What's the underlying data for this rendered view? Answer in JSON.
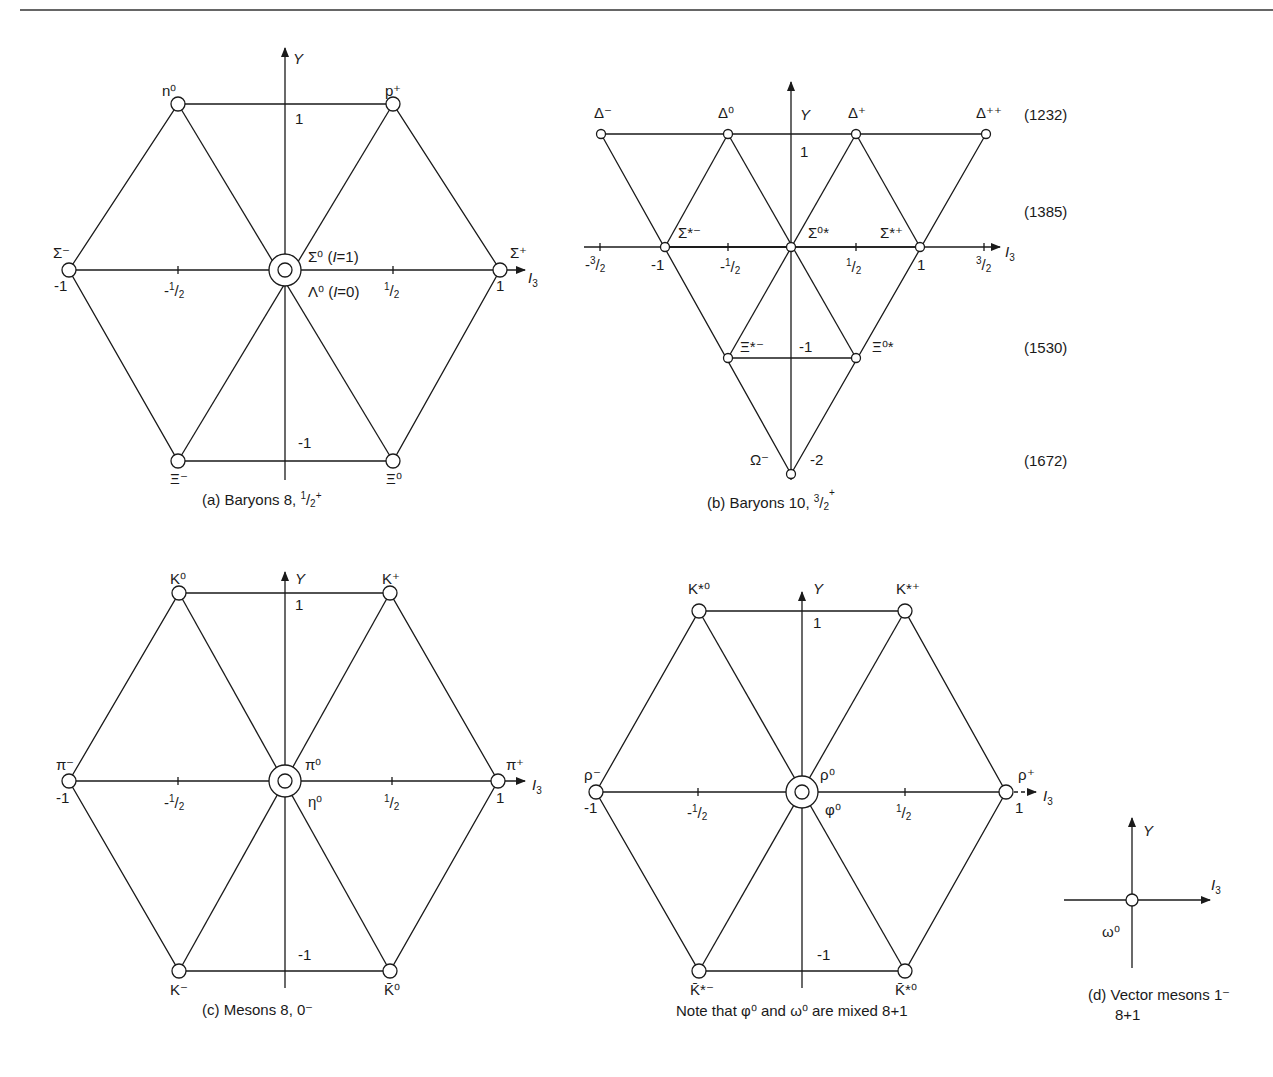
{
  "figure": {
    "header_rule": true,
    "panels": [
      {
        "id": "a",
        "type": "octet",
        "caption": "(a) Baryons 8, ½⁺",
        "caption_main": "(a) Baryons 8, ",
        "caption_spin": "1/2",
        "caption_parity": "+",
        "axis_y_label": "Y",
        "axis_x_label": "I",
        "axis_x_sub": "3",
        "ticks": {
          "y_top": "1",
          "y_bottom": "-1",
          "x_left": "-1",
          "x_right": "1",
          "x_half_neg": "-1/2",
          "x_half_pos": "1/2"
        },
        "particles": [
          {
            "name": "n⁰",
            "I3": -0.5,
            "Y": 1
          },
          {
            "name": "p⁺",
            "I3": 0.5,
            "Y": 1
          },
          {
            "name": "Σ⁻",
            "I3": -1,
            "Y": 0
          },
          {
            "name": "Σ⁰ (I=1)",
            "I3": 0,
            "Y": 0
          },
          {
            "name": "Λ⁰ (I=0)",
            "I3": 0,
            "Y": 0
          },
          {
            "name": "Σ⁺",
            "I3": 1,
            "Y": 0
          },
          {
            "name": "Ξ⁻",
            "I3": -0.5,
            "Y": -1
          },
          {
            "name": "Ξ⁰",
            "I3": 0.5,
            "Y": -1
          }
        ]
      },
      {
        "id": "b",
        "type": "decuplet",
        "caption": "(b) Baryons 10, ³⁄₂⁺",
        "caption_main": "(b) Baryons 10, ",
        "caption_spin": "3/2",
        "caption_parity": "+",
        "axis_y_label": "Y",
        "axis_x_label": "I",
        "axis_x_sub": "3",
        "ticks": {
          "y_top": "1",
          "y_m1": "-1",
          "y_m2": "-2",
          "x_m32": "-3/2",
          "x_m1": "-1",
          "x_m12": "-1/2",
          "x_p12": "1/2",
          "x_p1": "1",
          "x_p32": "3/2"
        },
        "particles": [
          {
            "name": "Δ⁻",
            "I3": -1.5,
            "Y": 1
          },
          {
            "name": "Δ⁰",
            "I3": -0.5,
            "Y": 1
          },
          {
            "name": "Δ⁺",
            "I3": 0.5,
            "Y": 1
          },
          {
            "name": "Δ⁺⁺",
            "I3": 1.5,
            "Y": 1
          },
          {
            "name": "Σ*⁻",
            "I3": -1,
            "Y": 0
          },
          {
            "name": "Σ*⁰",
            "I3": 0,
            "Y": 0
          },
          {
            "name": "Σ*⁺",
            "I3": 1,
            "Y": 0
          },
          {
            "name": "Ξ*⁻",
            "I3": -0.5,
            "Y": -1
          },
          {
            "name": "Ξ*⁰",
            "I3": 0.5,
            "Y": -1
          },
          {
            "name": "Ω⁻",
            "I3": 0,
            "Y": -2
          }
        ],
        "masses_MeV": [
          {
            "row_Y": 1,
            "value": "(1232)"
          },
          {
            "row_Y": 0,
            "value": "(1385)"
          },
          {
            "row_Y": -1,
            "value": "(1530)"
          },
          {
            "row_Y": -2,
            "value": "(1672)"
          }
        ]
      },
      {
        "id": "c",
        "type": "octet",
        "caption": "(c) Mesons 8, 0⁻",
        "caption_main": "(c) Mesons 8, 0",
        "caption_parity": "-",
        "axis_y_label": "Y",
        "axis_x_label": "I",
        "axis_x_sub": "3",
        "ticks": {
          "y_top": "1",
          "y_bottom": "-1",
          "x_left": "-1",
          "x_right": "1",
          "x_half_neg": "-1/2",
          "x_half_pos": "1/2"
        },
        "particles": [
          {
            "name": "K⁰",
            "I3": -0.5,
            "Y": 1
          },
          {
            "name": "K⁺",
            "I3": 0.5,
            "Y": 1
          },
          {
            "name": "π⁻",
            "I3": -1,
            "Y": 0
          },
          {
            "name": "π⁰",
            "I3": 0,
            "Y": 0
          },
          {
            "name": "η⁰",
            "I3": 0,
            "Y": 0
          },
          {
            "name": "π⁺",
            "I3": 1,
            "Y": 0
          },
          {
            "name": "K⁻",
            "I3": -0.5,
            "Y": -1
          },
          {
            "name": "K̄⁰",
            "I3": 0.5,
            "Y": -1
          }
        ]
      },
      {
        "id": "vector",
        "type": "octet",
        "caption": "Note that φ⁰ and ω⁰ are mixed 8+1",
        "axis_y_label": "Y",
        "axis_x_label": "I",
        "axis_x_sub": "3",
        "ticks": {
          "y_top": "1",
          "y_bottom": "-1",
          "x_left": "-1",
          "x_right": "1",
          "x_half_neg": "-1/2",
          "x_half_pos": "1/2"
        },
        "particles": [
          {
            "name": "K*⁰",
            "I3": -0.5,
            "Y": 1
          },
          {
            "name": "K*⁺",
            "I3": 0.5,
            "Y": 1
          },
          {
            "name": "ρ⁻",
            "I3": -1,
            "Y": 0
          },
          {
            "name": "ρ⁰",
            "I3": 0,
            "Y": 0
          },
          {
            "name": "φ⁰",
            "I3": 0,
            "Y": 0
          },
          {
            "name": "ρ⁺",
            "I3": 1,
            "Y": 0
          },
          {
            "name": "K̄*⁻",
            "I3": -0.5,
            "Y": -1
          },
          {
            "name": "K̄*⁰",
            "I3": 0.5,
            "Y": -1
          }
        ]
      },
      {
        "id": "d",
        "type": "singlet",
        "caption_line1": "(d) Vector mesons 1⁻",
        "caption_line2": "8+1",
        "axis_y_label": "Y",
        "axis_x_label": "I",
        "axis_x_sub": "3",
        "particles": [
          {
            "name": "ω⁰",
            "I3": 0,
            "Y": 0
          }
        ]
      }
    ]
  },
  "text": {
    "a": {
      "top_left": "n⁰",
      "top_right": "p⁺",
      "left": "Σ⁻",
      "right": "Σ⁺",
      "center_up": "Σ⁰ (",
      "center_up_I": "I",
      "center_up_end": "=1)",
      "center_down": "Λ⁰ (",
      "center_down_I": "I",
      "center_down_end": "=0)",
      "bot_left": "Ξ⁻",
      "bot_right": "Ξ⁰",
      "Y": "Y",
      "I": "I",
      "sub3": "3",
      "one": "1",
      "mone": "-1",
      "half_n": "-",
      "half_p": "",
      "half_num": "1",
      "half_den": "2",
      "cap": "(a) Baryons 8, ",
      "cap_num": "1",
      "cap_den": "2",
      "cap_sup": "+"
    },
    "b": {
      "d_m": "Δ⁻",
      "d_0": "Δ⁰",
      "d_p": "Δ⁺",
      "d_pp": "Δ⁺⁺",
      "s_m": "Σ*⁻",
      "s_0": "Σ⁰*",
      "s_p": "Σ*⁺",
      "x_m": "Ξ*⁻",
      "x_0": "Ξ⁰*",
      "om": "Ω⁻",
      "Y": "Y",
      "I": "I",
      "sub3": "3",
      "one": "1",
      "m1": "-1",
      "m2": "-2",
      "xm1": "-1",
      "xp1": "1",
      "three": "3",
      "one_n": "1",
      "two": "2",
      "minus": "-",
      "m1232": "(1232)",
      "m1385": "(1385)",
      "m1530": "(1530)",
      "m1672": "(1672)",
      "cap": "(b) Baryons 10, ",
      "cap_num": "3",
      "cap_den": "2",
      "cap_sup": "+"
    },
    "c": {
      "top_left": "K⁰",
      "top_right": "K⁺",
      "left": "π⁻",
      "right": "π⁺",
      "center_up": "π⁰",
      "center_down": "η⁰",
      "bot_left": "K⁻",
      "bot_right": "K̄⁰",
      "Y": "Y",
      "I": "I",
      "sub3": "3",
      "one": "1",
      "mone": "-1",
      "cap": "(c) Mesons 8, 0⁻"
    },
    "v": {
      "top_left": "K*⁰",
      "top_right": "K*⁺",
      "left": "ρ⁻",
      "right": "ρ⁺",
      "center_up": "ρ⁰",
      "center_down": "φ⁰",
      "bot_left": "K̄*⁻",
      "bot_right": "K̄*⁰",
      "Y": "Y",
      "I": "I",
      "sub3": "3",
      "one": "1",
      "mone": "-1",
      "cap": "Note that φ⁰ and ω⁰ are mixed 8+1"
    },
    "d": {
      "Y": "Y",
      "I": "I",
      "sub3": "3",
      "omega": "ω⁰",
      "cap1": "(d) Vector mesons 1⁻",
      "cap2": "8+1"
    }
  }
}
